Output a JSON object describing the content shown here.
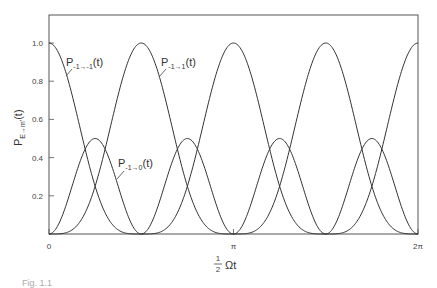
{
  "chart_data": {
    "type": "line",
    "title": "",
    "xlabel": "½Ωt",
    "ylabel": "P_{E→m'}(t)",
    "xlim": [
      0,
      6.283185
    ],
    "ylim": [
      0,
      1.08
    ],
    "grid": false,
    "legend": "inline labels",
    "x_ticks": [
      {
        "value": 0,
        "label": "0"
      },
      {
        "value": 3.141593,
        "label": "π"
      },
      {
        "value": 6.283185,
        "label": "2π"
      }
    ],
    "y_ticks": [
      {
        "value": 0.2,
        "label": "0.2"
      },
      {
        "value": 0.4,
        "label": "0.4"
      },
      {
        "value": 0.6,
        "label": "0.6"
      },
      {
        "value": 0.8,
        "label": "0.8"
      },
      {
        "value": 1.0,
        "label": "1.0"
      }
    ],
    "x": [
      0,
      0.3927,
      0.7854,
      1.1781,
      1.5708,
      1.9635,
      2.3562,
      2.7489,
      3.1416,
      3.5343,
      3.927,
      4.3197,
      4.7124,
      5.1051,
      5.4978,
      5.8905,
      6.2832
    ],
    "series": [
      {
        "name": "P_{-1→-1}(t)",
        "formula": "cos^4(½Ωt)",
        "values": [
          1.0,
          0.729,
          0.25,
          0.021,
          0.0,
          0.021,
          0.25,
          0.729,
          1.0,
          0.729,
          0.25,
          0.021,
          0.0,
          0.021,
          0.25,
          0.729,
          1.0
        ]
      },
      {
        "name": "P_{-1→1}(t)",
        "formula": "sin^4(½Ωt)",
        "values": [
          0.0,
          0.021,
          0.25,
          0.729,
          1.0,
          0.729,
          0.25,
          0.021,
          0.0,
          0.021,
          0.25,
          0.729,
          1.0,
          0.729,
          0.25,
          0.021,
          0.0
        ]
      },
      {
        "name": "P_{-1→0}(t)",
        "formula": "½ sin^2(Ωt)",
        "values": [
          0.0,
          0.25,
          0.5,
          0.25,
          0.0,
          0.25,
          0.5,
          0.25,
          0.0,
          0.25,
          0.5,
          0.25,
          0.0,
          0.25,
          0.5,
          0.25,
          0.0
        ]
      }
    ],
    "annotations": [
      {
        "text": "P",
        "sub": "-1→-1",
        "suffix": "(t)",
        "series": 0
      },
      {
        "text": "P",
        "sub": "-1→1",
        "suffix": "(t)",
        "series": 1
      },
      {
        "text": "P",
        "sub": "-1→0",
        "suffix": "(t)",
        "series": 2
      }
    ]
  },
  "axis": {
    "y_label_main": "P",
    "y_label_sub": "E→m'",
    "y_label_suffix": "(t)",
    "x_label_frac_num": "1",
    "x_label_frac_den": "2",
    "x_label_rest": "Ωt"
  },
  "caption": "Fig. 1.1"
}
